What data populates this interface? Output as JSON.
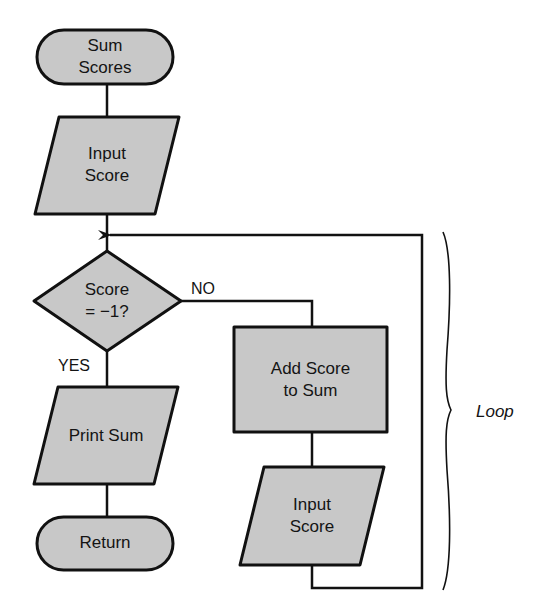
{
  "diagram": {
    "type": "flowchart",
    "colors": {
      "fill": "#c8c8c8",
      "stroke": "#111111",
      "text": "#141414",
      "background": "#ffffff"
    },
    "nodes": {
      "start": {
        "shape": "terminal",
        "label": "Sum\nScores"
      },
      "input1": {
        "shape": "parallelogram",
        "label": "Input\nScore"
      },
      "decision": {
        "shape": "diamond",
        "label": "Score\n= −1?"
      },
      "add": {
        "shape": "rectangle",
        "label": "Add Score\nto Sum"
      },
      "input2": {
        "shape": "parallelogram",
        "label": "Input\nScore"
      },
      "print": {
        "shape": "parallelogram",
        "label": "Print Sum"
      },
      "end": {
        "shape": "terminal",
        "label": "Return"
      }
    },
    "edges": {
      "no_label": "NO",
      "yes_label": "YES"
    },
    "annotations": {
      "loop_label": "Loop"
    }
  }
}
